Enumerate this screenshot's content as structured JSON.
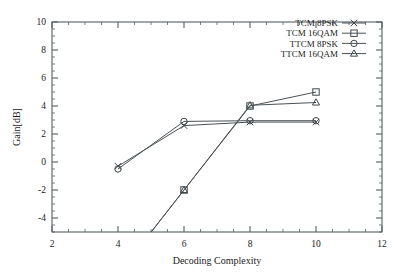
{
  "chart_data": {
    "type": "line",
    "title": "",
    "xlabel": "Decoding Complexity",
    "ylabel": "Gain[dB]",
    "xlim": [
      2,
      12
    ],
    "ylim": [
      -5,
      10
    ],
    "xticks": [
      2,
      4,
      6,
      8,
      10,
      12
    ],
    "yticks": [
      -4,
      -2,
      0,
      2,
      4,
      6,
      8,
      10
    ],
    "xtick_labels": [
      "2",
      "4",
      "6",
      "8",
      "10",
      "12"
    ],
    "ytick_labels": [
      "-4",
      "-2",
      "0",
      "2",
      "4",
      "6",
      "8",
      "10"
    ],
    "grid": false,
    "minor_ticks": true,
    "legend_position": "top-right",
    "series": [
      {
        "name": "TCM 8PSK",
        "marker": "cross",
        "x": [
          4,
          6,
          8,
          10
        ],
        "y": [
          -0.3,
          2.6,
          2.85,
          2.85
        ]
      },
      {
        "name": "TCM 16QAM",
        "marker": "square",
        "x": [
          6,
          8,
          10
        ],
        "y": [
          -2.0,
          4.0,
          5.0
        ]
      },
      {
        "name": "TTCM 8PSK",
        "marker": "circle",
        "x": [
          4,
          6,
          8,
          10
        ],
        "y": [
          -0.5,
          2.9,
          2.95,
          2.95
        ]
      },
      {
        "name": "TTCM 16QAM",
        "marker": "triangle",
        "x": [
          6,
          8,
          10
        ],
        "y": [
          -2.0,
          4.05,
          4.25
        ]
      }
    ]
  },
  "axes": {
    "x_title": "Decoding Complexity",
    "y_title": "Gain[dB]"
  },
  "legend": {
    "entries": [
      {
        "label": "TCM 8PSK",
        "marker": "cross-marker"
      },
      {
        "label": "TCM 16QAM",
        "marker": "square-marker"
      },
      {
        "label": "TTCM 8PSK",
        "marker": "circle-marker"
      },
      {
        "label": "TTCM 16QAM",
        "marker": "triangle-marker"
      }
    ]
  },
  "colors": {
    "line": "#4a5257",
    "axis": "#555f63",
    "text": "#1a1a1a",
    "background": "#ffffff"
  }
}
